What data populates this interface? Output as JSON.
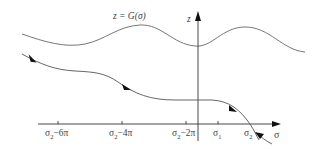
{
  "figure": {
    "curve_label": "z = G(σ)",
    "z_axis_label": "z",
    "sigma_axis_label": "σ",
    "ticks": [
      {
        "label": "σ₂−6π",
        "base": "σ",
        "sub": "2",
        "suffix": "−6π"
      },
      {
        "label": "σ₂−4π",
        "base": "σ",
        "sub": "2",
        "suffix": "−4π"
      },
      {
        "label": "σ₂−2π",
        "base": "σ",
        "sub": "2",
        "suffix": "−2π"
      },
      {
        "label": "σ₁",
        "base": "σ",
        "sub": "1",
        "suffix": ""
      },
      {
        "label": "σ₂",
        "base": "σ",
        "sub": "2",
        "suffix": ""
      }
    ],
    "colors": {
      "axes": "#333333",
      "curve": "#666666",
      "trajectory": "#555555",
      "arrow": "#111111"
    }
  }
}
